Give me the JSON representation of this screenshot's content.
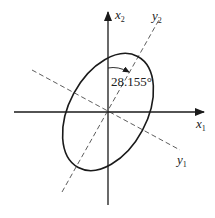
{
  "diagram": {
    "axes": {
      "x1": {
        "label": "x",
        "subscript": "1"
      },
      "x2": {
        "label": "x",
        "subscript": "2"
      },
      "y1": {
        "label": "y",
        "subscript": "1"
      },
      "y2": {
        "label": "y",
        "subscript": "2"
      }
    },
    "angle": {
      "value": "28.155°"
    },
    "colors": {
      "stroke": "#1a1a1a",
      "background": "#ffffff"
    }
  }
}
